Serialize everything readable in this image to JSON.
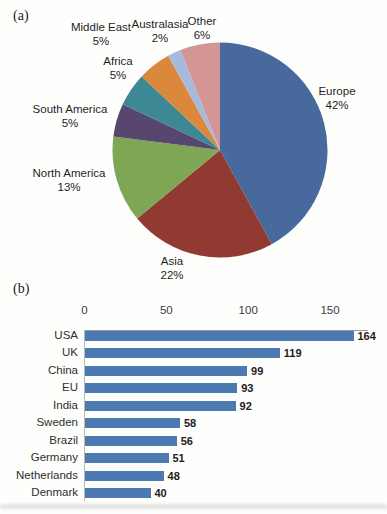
{
  "page": {
    "panel_a_label": "(a)",
    "panel_b_label": "(b)"
  },
  "colors": {
    "bar_blue": "#4C79B0",
    "axis_line": "#9b9b9b"
  },
  "chart_data": [
    {
      "type": "pie",
      "title": "",
      "direction": "clockwise-from-top",
      "slices": [
        {
          "label": "Europe",
          "value": 42,
          "pct_label": "42%",
          "color": "#47699E"
        },
        {
          "label": "Asia",
          "value": 22,
          "pct_label": "22%",
          "color": "#913A31"
        },
        {
          "label": "North America",
          "value": 13,
          "pct_label": "13%",
          "color": "#7EA755"
        },
        {
          "label": "South America",
          "value": 5,
          "pct_label": "5%",
          "color": "#57466E"
        },
        {
          "label": "Africa",
          "value": 5,
          "pct_label": "5%",
          "color": "#3C8894"
        },
        {
          "label": "Middle East",
          "value": 5,
          "pct_label": "5%",
          "color": "#D9883C"
        },
        {
          "label": "Australasia",
          "value": 2,
          "pct_label": "2%",
          "color": "#A6BADC"
        },
        {
          "label": "Other",
          "value": 6,
          "pct_label": "6%",
          "color": "#D39694"
        }
      ]
    },
    {
      "type": "bar",
      "orientation": "horizontal",
      "categories": [
        "USA",
        "UK",
        "China",
        "EU",
        "India",
        "Sweden",
        "Brazil",
        "Germany",
        "Netherlands",
        "Denmark"
      ],
      "values": [
        164,
        119,
        99,
        93,
        92,
        58,
        56,
        51,
        48,
        40
      ],
      "axis_ticks": [
        0,
        50,
        100,
        150
      ],
      "xlim": [
        0,
        150
      ],
      "axis_position": "top",
      "grid": false,
      "legend": false,
      "bar_color": "#4C79B0"
    }
  ]
}
